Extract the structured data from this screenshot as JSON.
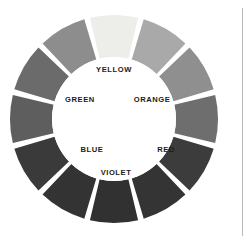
{
  "figure": {
    "name": "color-wheel",
    "rendering": "grayscale",
    "segment_count": 12,
    "background_color": "#ffffff",
    "center_fill": "#ffffff",
    "gap_color": "#ffffff",
    "geometry": {
      "center_x": 114,
      "center_y": 119,
      "outer_radius": 104,
      "inner_radius": 62,
      "gap_degrees": 3.2
    },
    "divider_rule_color": "#b9b9b9"
  },
  "segments": [
    {
      "name": "yellow",
      "label": "YELLOW",
      "labeled": true,
      "angle": 270,
      "color": "#ededea"
    },
    {
      "name": "yellow-orange",
      "label": "",
      "labeled": false,
      "angle": 300,
      "color": "#a9a9a9"
    },
    {
      "name": "orange",
      "label": "ORANGE",
      "labeled": true,
      "angle": 330,
      "color": "#8f8f8f"
    },
    {
      "name": "red-orange",
      "label": "",
      "labeled": false,
      "angle": 0,
      "color": "#6e6e6e"
    },
    {
      "name": "red",
      "label": "RED",
      "labeled": true,
      "angle": 30,
      "color": "#3c3c3c"
    },
    {
      "name": "red-violet",
      "label": "",
      "labeled": false,
      "angle": 60,
      "color": "#343434"
    },
    {
      "name": "violet",
      "label": "VIOLET",
      "labeled": true,
      "angle": 90,
      "color": "#313131"
    },
    {
      "name": "blue-violet",
      "label": "",
      "labeled": false,
      "angle": 120,
      "color": "#333333"
    },
    {
      "name": "blue",
      "label": "BLUE",
      "labeled": true,
      "angle": 150,
      "color": "#3a3a3a"
    },
    {
      "name": "blue-green",
      "label": "",
      "labeled": false,
      "angle": 180,
      "color": "#5e5e5e"
    },
    {
      "name": "green",
      "label": "GREEN",
      "labeled": true,
      "angle": 210,
      "color": "#6b6b6b"
    },
    {
      "name": "yellow-green",
      "label": "",
      "labeled": false,
      "angle": 240,
      "color": "#8d8d8d"
    }
  ],
  "labels": [
    {
      "name": "label-yellow",
      "text": "YELLOW",
      "x": 114,
      "y": 72
    },
    {
      "name": "label-orange",
      "text": "ORANGE",
      "x": 152,
      "y": 102
    },
    {
      "name": "label-red",
      "text": "RED",
      "x": 166,
      "y": 152
    },
    {
      "name": "label-violet",
      "text": "VIOLET",
      "x": 116,
      "y": 175
    },
    {
      "name": "label-blue",
      "text": "BLUE",
      "x": 92,
      "y": 152
    },
    {
      "name": "label-green",
      "text": "GREEN",
      "x": 80,
      "y": 102
    }
  ]
}
